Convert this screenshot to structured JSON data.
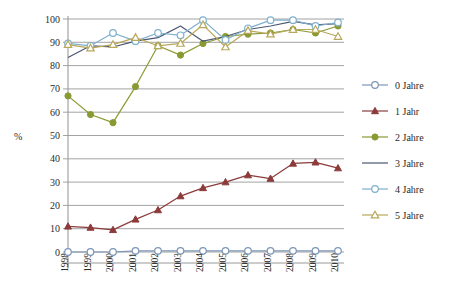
{
  "chart_data": {
    "type": "line",
    "title": "",
    "xlabel": "",
    "ylabel": "%",
    "ylim": [
      0,
      100
    ],
    "yticks": [
      0,
      10,
      20,
      30,
      40,
      50,
      60,
      70,
      80,
      90,
      100
    ],
    "grid": true,
    "legend_position": "right",
    "categories": [
      "1998",
      "1999",
      "2000",
      "2001",
      "2002",
      "2003",
      "2004",
      "2005",
      "2006",
      "2007",
      "2008",
      "2009",
      "2010"
    ],
    "series": [
      {
        "name": "0 Jahre",
        "color": "#7d96b5",
        "marker": "circle-open",
        "values": [
          0,
          0,
          0,
          0.5,
          0.5,
          0.5,
          0.5,
          0.5,
          0.5,
          0.5,
          0.5,
          0.5,
          0.5
        ]
      },
      {
        "name": "1 Jahr",
        "color": "#8c3b3b",
        "marker": "triangle-filled",
        "values": [
          11,
          10.5,
          9.5,
          14,
          18,
          24,
          27.5,
          30,
          33,
          31.5,
          38,
          38.5,
          36
        ]
      },
      {
        "name": "2 Jahre",
        "color": "#8a9a33",
        "marker": "circle-filled",
        "values": [
          67,
          59,
          55.5,
          71,
          88.5,
          84.5,
          89.5,
          92.5,
          93.5,
          94,
          95.5,
          94,
          97
        ]
      },
      {
        "name": "3 Jahre",
        "color": "#4a5772",
        "marker": "none",
        "values": [
          83.5,
          88.5,
          88,
          90.5,
          92,
          97,
          90.5,
          92.5,
          95.5,
          97,
          99,
          97.5,
          98
        ]
      },
      {
        "name": "4 Jahre",
        "color": "#7fb0cc",
        "marker": "circle-open",
        "values": [
          89.5,
          88.5,
          94,
          90.5,
          94,
          93,
          99.5,
          91,
          96,
          99.5,
          99.5,
          97,
          98.5
        ]
      },
      {
        "name": "5 Jahre",
        "color": "#b8a85c",
        "marker": "triangle-open",
        "values": [
          89,
          87.5,
          89,
          92,
          88.5,
          89.5,
          97.5,
          88,
          95,
          93.5,
          95.5,
          95.5,
          92.5
        ]
      }
    ]
  },
  "legend": {
    "items": [
      {
        "label": "0 Jahre"
      },
      {
        "label": "1 Jahr"
      },
      {
        "label": "2 Jahre"
      },
      {
        "label": "3 Jahre"
      },
      {
        "label": "4 Jahre"
      },
      {
        "label": "5 Jahre"
      }
    ]
  }
}
